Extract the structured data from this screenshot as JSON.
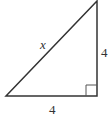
{
  "diagram": {
    "type": "right-triangle",
    "stroke_color": "#333333",
    "labels": {
      "hypotenuse": "x",
      "vertical_leg": "4",
      "horizontal_leg": "4"
    },
    "right_angle_marker": true
  }
}
